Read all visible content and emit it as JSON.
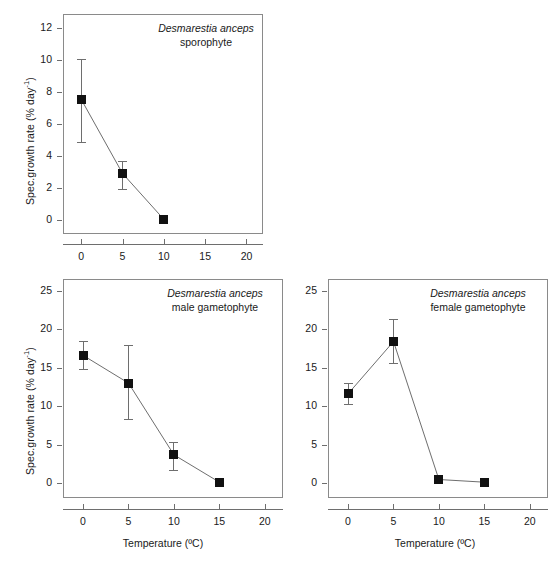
{
  "figure": {
    "axis_labels": {
      "x": "Temperature (ºC)",
      "y_prefix": "Spec.growth rate (% day",
      "y_exponent": "-1",
      "y_suffix": ")"
    },
    "colors": {
      "marker": "#111111",
      "line": "#6e6e6e",
      "frame": "#8a8a8a",
      "text": "#1a1a1a"
    }
  },
  "chart_data": [
    {
      "type": "line",
      "panel": "top",
      "title_italic": "Desmarestia anceps",
      "title_plain": "sporophyte",
      "xlabel": "",
      "ylabel": "Spec.growth rate (% day-1)",
      "x": [
        0,
        5,
        10
      ],
      "values": [
        7.55,
        2.9,
        0.02
      ],
      "err_low": [
        2.65,
        0.95,
        0.0
      ],
      "err_high": [
        2.55,
        0.75,
        0.0
      ],
      "xlim": [
        -2.2,
        22
      ],
      "ylim": [
        -0.9,
        12.9
      ],
      "xticks": [
        0,
        5,
        10,
        15,
        20
      ],
      "xticklabels": [
        "0",
        "5",
        "10",
        "15",
        "20"
      ],
      "yticks": [
        0,
        2,
        4,
        6,
        8,
        10,
        12
      ],
      "yticklabels": [
        "0",
        "2",
        "4",
        "6",
        "8",
        "10",
        "12"
      ],
      "grid": false,
      "legend": "none"
    },
    {
      "type": "line",
      "panel": "bottom-left",
      "title_italic": "Desmarestia anceps",
      "title_plain": "male gametophyte",
      "xlabel": "Temperature (ºC)",
      "ylabel": "Spec.growth rate (% day-1)",
      "x": [
        0,
        5,
        10,
        15
      ],
      "values": [
        16.6,
        13.0,
        3.7,
        0.15
      ],
      "err_low": [
        1.8,
        4.7,
        2.0,
        0.0
      ],
      "err_high": [
        1.9,
        5.0,
        1.7,
        0.0
      ],
      "xlim": [
        -2.2,
        22
      ],
      "ylim": [
        -1.9,
        26.5
      ],
      "xticks": [
        0,
        5,
        10,
        15,
        20
      ],
      "xticklabels": [
        "0",
        "5",
        "10",
        "15",
        "20"
      ],
      "yticks": [
        0,
        5,
        10,
        15,
        20,
        25
      ],
      "yticklabels": [
        "0",
        "5",
        "10",
        "15",
        "20",
        "25"
      ],
      "grid": false,
      "legend": "none"
    },
    {
      "type": "line",
      "panel": "bottom-right",
      "title_italic": "Desmarestia anceps",
      "title_plain": "female gametophyte",
      "xlabel": "Temperature (ºC)",
      "ylabel": "",
      "x": [
        0,
        5,
        10,
        15
      ],
      "values": [
        11.6,
        18.4,
        0.5,
        0.15
      ],
      "err_low": [
        1.3,
        2.8,
        0.0,
        0.0
      ],
      "err_high": [
        1.4,
        2.9,
        0.0,
        0.0
      ],
      "xlim": [
        -2.2,
        22
      ],
      "ylim": [
        -1.9,
        26.5
      ],
      "xticks": [
        0,
        5,
        10,
        15,
        20
      ],
      "xticklabels": [
        "0",
        "5",
        "10",
        "15",
        "20"
      ],
      "yticks": [
        0,
        5,
        10,
        15,
        20,
        25
      ],
      "yticklabels": [
        "0",
        "5",
        "10",
        "15",
        "20",
        "25"
      ],
      "grid": false,
      "legend": "none"
    }
  ]
}
